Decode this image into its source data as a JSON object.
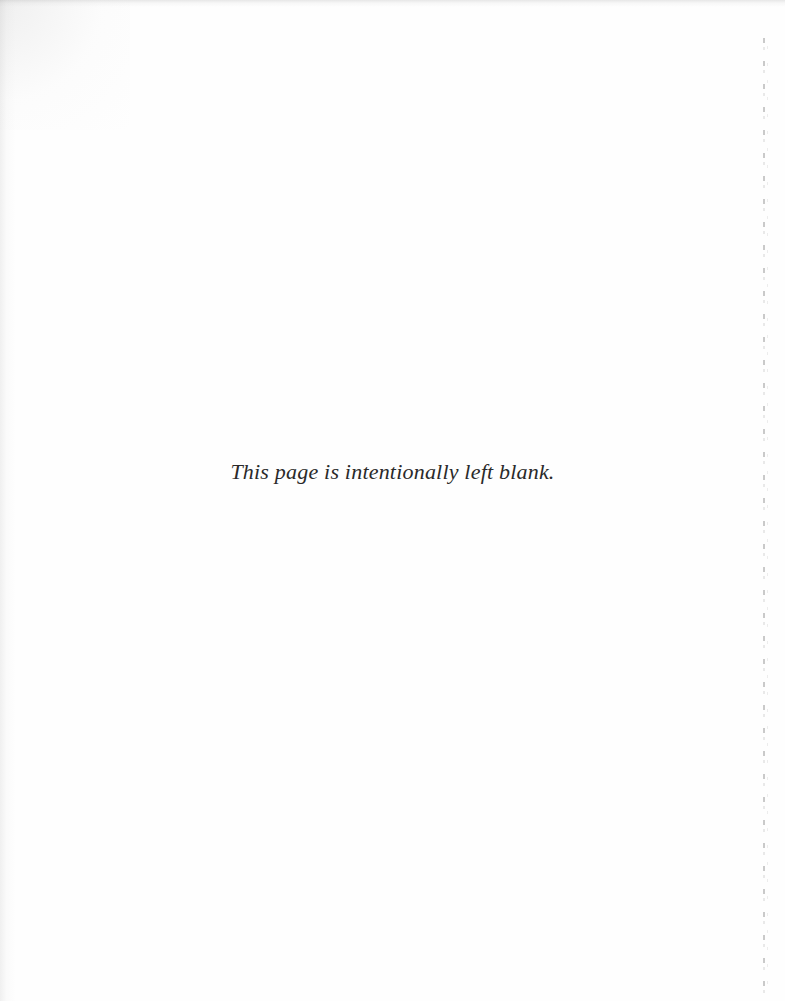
{
  "document": {
    "page_type": "intentionally-blank-page",
    "body_text": "This page is intentionally left blank.",
    "text_color": "#2a2a2a",
    "background_color": "#fefefe",
    "artifacts": {
      "top_edge_shadow": "",
      "left_edge_shadow": "",
      "corner_vignette": "",
      "gutter_dotted_line": "",
      "gutter_dotted_line_ghost": ""
    }
  }
}
